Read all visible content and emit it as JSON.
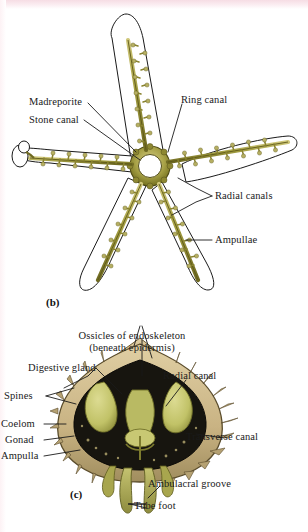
{
  "figure": {
    "panels": [
      {
        "tag": "(b)",
        "name": "water-vascular-system",
        "labels": [
          {
            "id": "madreporite",
            "text": "Madreporite"
          },
          {
            "id": "stone-canal",
            "text": "Stone canal"
          },
          {
            "id": "ring-canal",
            "text": "Ring canal"
          },
          {
            "id": "radial-canals",
            "text": "Radial canals"
          },
          {
            "id": "ampullae",
            "text": "Ampullae"
          }
        ]
      },
      {
        "tag": "(c)",
        "name": "arm-cross-section",
        "labels": [
          {
            "id": "ossicles",
            "text": "Ossicles of endoskeleton",
            "text2": "(beneath epidermis)"
          },
          {
            "id": "digestive-gland",
            "text": "Digestive gland"
          },
          {
            "id": "spines",
            "text": "Spines"
          },
          {
            "id": "coelom",
            "text": "Coelom"
          },
          {
            "id": "gonad",
            "text": "Gonad"
          },
          {
            "id": "ampulla",
            "text": "Ampulla"
          },
          {
            "id": "radial-canal",
            "text": "Radial canal"
          },
          {
            "id": "transverse-canal",
            "text": "Transverse canal"
          },
          {
            "id": "ambulacral-groove",
            "text": "Ambulacral groove"
          },
          {
            "id": "tube-foot",
            "text": "Tube foot"
          }
        ]
      }
    ],
    "colors": {
      "outline": "#1a1a1a",
      "canal_olive": "#a5a043",
      "canal_olive_dark": "#6f6a22",
      "canal_highlight": "#cfc77a",
      "ossicle_tan": "#cdb98a",
      "ossicle_tan_dark": "#9c8a5c",
      "coelom_dark": "#17150f",
      "gland_green": "#c3c46a",
      "body_wall": "#b9a575",
      "background": "#ffffff",
      "scan_pink": "#f6dde4"
    }
  }
}
